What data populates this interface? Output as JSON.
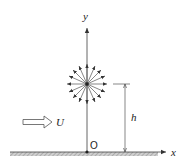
{
  "diagram": {
    "type": "point source above ground plane in uniform flow",
    "labels": {
      "y_axis": "y",
      "x_axis": "x",
      "origin": "O",
      "height": "h",
      "flow": "U"
    },
    "colors": {
      "line": "#444444",
      "ground_hatch": "#9a9a9a",
      "text": "#222222"
    },
    "source": {
      "ray_count": 16
    }
  }
}
